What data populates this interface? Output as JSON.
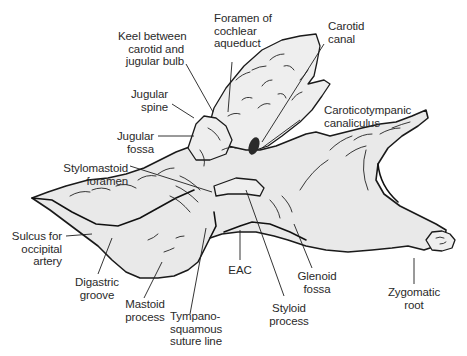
{
  "figure": {
    "background_color": "#ffffff",
    "line_color": "#1a1a1a",
    "bone_fill_color": "#e9e9e9",
    "label_color": "#2a2a2a"
  },
  "labels": {
    "foramen_cochlear_aqueduct": "Foramen of\ncochlear\naqueduct",
    "carotid_canal": "Carotid\ncanal",
    "keel": "Keel between\ncarotid and\njugular bulb",
    "jugular_spine": "Jugular\nspine",
    "caroticotympanic": "Caroticotympanic\ncanaliculus",
    "jugular_fossa": "Jugular\nfossa",
    "stylomastoid_foramen": "Stylomastoid\nforamen",
    "sulcus_occipital_artery": "Sulcus for\noccipital\nartery",
    "digastric_groove": "Digastric\ngroove",
    "mastoid_process": "Mastoid\nprocess",
    "tympanosquamous": "Tympano-\nsquamous\nsuture line",
    "eac": "EAC",
    "styloid_process": "Styloid\nprocess",
    "glenoid_fossa": "Glenoid\nfossa",
    "zygomatic_root": "Zygomatic\nroot"
  }
}
